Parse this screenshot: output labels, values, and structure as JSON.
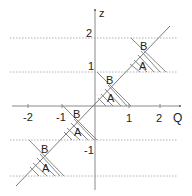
{
  "diagram": {
    "axes": {
      "x_label": "Q",
      "y_label": "z",
      "x_ticks": [
        "-2",
        "-1",
        "1",
        "2"
      ],
      "y_ticks": [
        "2",
        "1",
        "-1"
      ]
    },
    "regions": [
      {
        "upper": "B",
        "lower": "A",
        "at": "z from 1 to 2"
      },
      {
        "upper": "B",
        "lower": "A",
        "at": "z from 0 to 1"
      },
      {
        "upper": "B",
        "lower": "A",
        "at": "z from -1 to 0"
      },
      {
        "upper": "B",
        "lower": "A",
        "at": "z from -2 to -1"
      }
    ],
    "colors": {
      "axis": "#8a8a8a",
      "diagonal": "#7a7a7a",
      "gridline": "#b0b0b0",
      "text": "#222222"
    }
  }
}
